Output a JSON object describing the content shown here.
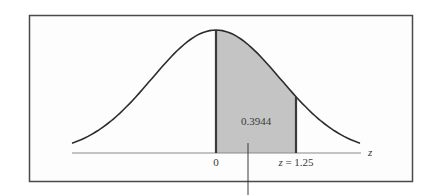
{
  "chart_data": {
    "type": "area",
    "title": "",
    "xlabel": "z",
    "ylabel": "",
    "distribution": "standard normal",
    "shaded_region": {
      "from": 0,
      "to": 1.25,
      "area": 0.3944
    },
    "x_ticks": [
      {
        "value": 0,
        "label": "0"
      },
      {
        "value": 1.25,
        "label": "z = 1.25"
      }
    ],
    "area_label": "0.3944",
    "axis_symbol": "z",
    "xlim": [
      -2.25,
      2.25
    ],
    "colors": {
      "shade": "#c4c4c4",
      "curve": "#2b2b2b",
      "frame": "#4a4a4a"
    }
  },
  "labels": {
    "area": "0.3944",
    "tick_zero": "0",
    "tick_z": "z = 1.25",
    "axis": "z"
  }
}
